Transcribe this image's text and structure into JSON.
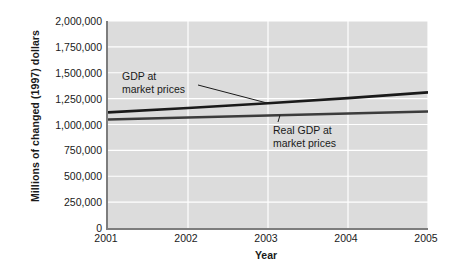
{
  "chart_data": {
    "type": "line",
    "title": "",
    "xlabel": "Year",
    "ylabel": "Millions of changed (1997) dollars",
    "x": [
      2001,
      2002,
      2003,
      2004,
      2005
    ],
    "xlim": [
      2001,
      2005
    ],
    "ylim": [
      0,
      2000000
    ],
    "xticks": [
      "2001",
      "2002",
      "2003",
      "2004",
      "2005"
    ],
    "yticks": [
      "0",
      "250,000",
      "500,000",
      "750,000",
      "1,000,000",
      "1,250,000",
      "1,500,000",
      "1,750,000",
      "2,000,000"
    ],
    "ytick_values": [
      0,
      250000,
      500000,
      750000,
      1000000,
      1250000,
      1500000,
      1750000,
      2000000
    ],
    "grid": true,
    "grid_color": "#ffffff",
    "plot_background": "#dcdcdc",
    "legend": "none",
    "series": [
      {
        "name": "GDP at market prices",
        "color": "#1a1a1a",
        "values": [
          1117000,
          1160000,
          1205000,
          1255000,
          1310000
        ]
      },
      {
        "name": "Real GDP at market prices",
        "color": "#3c3c3c",
        "values": [
          1049000,
          1068000,
          1087000,
          1107000,
          1126000
        ]
      }
    ],
    "annotations": [
      {
        "name": "gdp-at-market-prices",
        "line1": "GDP at",
        "line2": "market prices",
        "target_year": 2003,
        "target_value": 1205000
      },
      {
        "name": "real-gdp-at-market-prices",
        "line1": "Real GDP at",
        "line2": "market prices",
        "target_year": 2003.15,
        "target_value": 1090000
      }
    ]
  },
  "axes": {
    "y_title": "Millions of changed (1997) dollars",
    "x_title": "Year"
  }
}
